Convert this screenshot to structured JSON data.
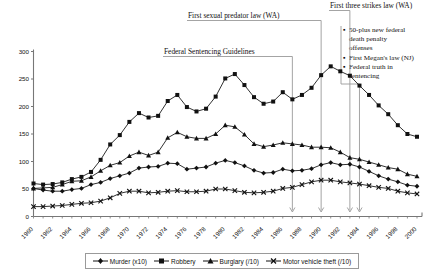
{
  "chart_data": {
    "type": "line",
    "title": "",
    "xlabel": "",
    "ylabel": "",
    "ylim": [
      0,
      300
    ],
    "ytick_step": 50,
    "yticks": [
      0,
      50,
      100,
      150,
      200,
      250,
      300
    ],
    "grid": false,
    "legend_position": "bottom",
    "x": [
      1960,
      1961,
      1962,
      1963,
      1964,
      1965,
      1966,
      1967,
      1968,
      1969,
      1970,
      1971,
      1972,
      1973,
      1974,
      1975,
      1976,
      1977,
      1978,
      1979,
      1980,
      1981,
      1982,
      1983,
      1984,
      1985,
      1986,
      1987,
      1988,
      1989,
      1990,
      1991,
      1992,
      1993,
      1994,
      1995,
      1996,
      1997,
      1998,
      1999,
      2000
    ],
    "xtick_labels": [
      "1960",
      "1962",
      "1964",
      "1966",
      "1968",
      "1970",
      "1972",
      "1974",
      "1976",
      "1978",
      "1980",
      "1982",
      "1984",
      "1986",
      "1988",
      "1990",
      "1992",
      "1994",
      "1996",
      "1998",
      "2000"
    ],
    "series": [
      {
        "name": "Murder (x10)",
        "marker": "diamond",
        "color": "#1a1a1a",
        "values": [
          51,
          48,
          46,
          46,
          49,
          51,
          58,
          62,
          69,
          74,
          79,
          88,
          90,
          91,
          97,
          96,
          86,
          88,
          90,
          97,
          102,
          98,
          92,
          84,
          79,
          80,
          86,
          83,
          84,
          87,
          94,
          98,
          94,
          95,
          90,
          82,
          74,
          68,
          63,
          57,
          55
        ]
      },
      {
        "name": "Robbery",
        "marker": "square",
        "color": "#1a1a1a",
        "values": [
          60,
          58,
          59,
          62,
          68,
          72,
          81,
          103,
          131,
          148,
          172,
          188,
          180,
          183,
          210,
          221,
          199,
          191,
          196,
          218,
          251,
          259,
          239,
          217,
          205,
          209,
          226,
          213,
          221,
          234,
          257,
          273,
          264,
          256,
          238,
          221,
          202,
          186,
          166,
          150,
          145
        ]
      },
      {
        "name": "Burglary (/10)",
        "marker": "triangle",
        "color": "#1a1a1a",
        "values": [
          51,
          52,
          53,
          58,
          64,
          65,
          72,
          83,
          93,
          98,
          110,
          117,
          111,
          117,
          143,
          153,
          145,
          142,
          142,
          150,
          166,
          163,
          149,
          132,
          127,
          130,
          134,
          132,
          130,
          126,
          126,
          125,
          117,
          107,
          104,
          99,
          94,
          89,
          86,
          77,
          73
        ]
      },
      {
        "name": "Motor vehicle theft (/10)",
        "marker": "x",
        "color": "#1a1a1a",
        "values": [
          18,
          18,
          19,
          20,
          22,
          24,
          25,
          28,
          34,
          42,
          46,
          46,
          43,
          44,
          46,
          47,
          45,
          45,
          46,
          50,
          50,
          47,
          44,
          43,
          44,
          46,
          51,
          53,
          58,
          63,
          66,
          66,
          63,
          61,
          59,
          56,
          53,
          51,
          46,
          43,
          41
        ]
      }
    ],
    "annotations": [
      {
        "id": "federal-sentencing-guidelines",
        "text": "Federal Sentencing Guidelines",
        "arrow_year": 1987
      },
      {
        "id": "first-sexual-predator-law",
        "text": "First sexual predator law (WA)",
        "arrow_year": 1990
      },
      {
        "id": "first-three-strikes-law",
        "text": "First three strikes law (WA)",
        "arrow_year": 1993
      },
      {
        "id": "federal-bullets",
        "arrow_year": 1994,
        "bullets": [
          "50-plus new federal death penalty offenses",
          "First Megan's law (NJ)",
          "Federal truth in sentencing"
        ],
        "bullet_lines": [
          [
            "50-plus new federal",
            "death penalty",
            "offenses"
          ],
          [
            "First Megan's law (NJ)"
          ],
          [
            "Federal truth in",
            "sentencing"
          ]
        ]
      }
    ]
  }
}
